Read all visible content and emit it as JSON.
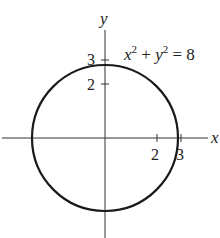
{
  "figure": {
    "equation": {
      "base_x": "x",
      "exp_x": "2",
      "plus": " + ",
      "base_y": "y",
      "exp_y": "2",
      "equals": " = 8"
    },
    "axes": {
      "x_label": "x",
      "y_label": "y"
    },
    "x_ticks": [
      "2",
      "3"
    ],
    "y_ticks": [
      "2",
      "3"
    ],
    "colors": {
      "stroke": "#1a1a1a",
      "axis": "#333333",
      "background": "#ffffff"
    }
  }
}
